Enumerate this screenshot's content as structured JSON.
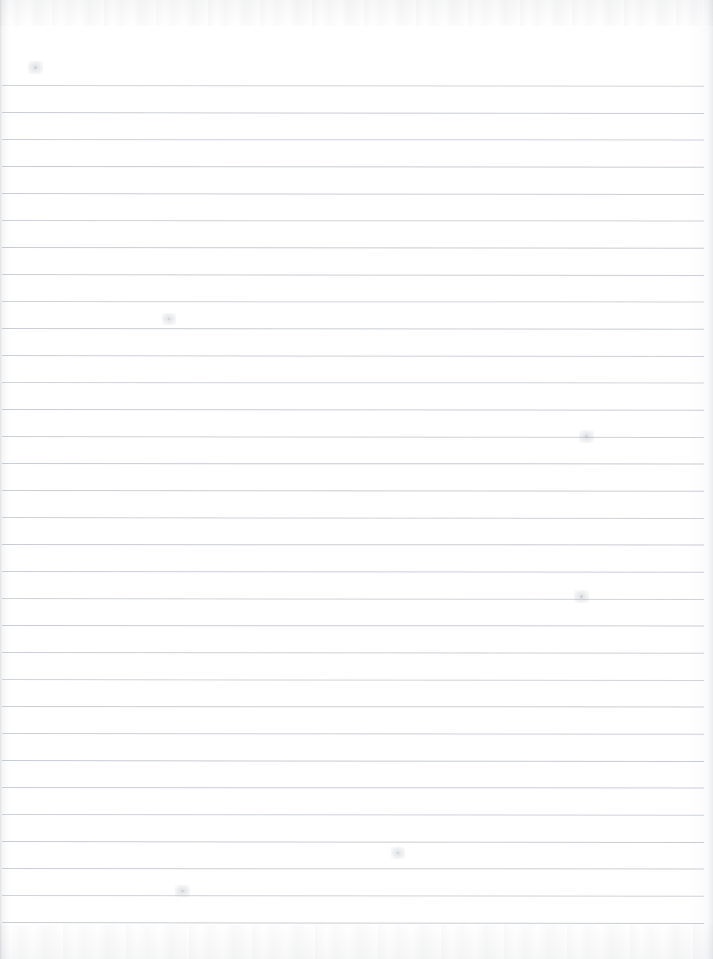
{
  "document": {
    "type": "scanned-lined-notebook-paper",
    "title": "Blank Ruled Notebook Page",
    "page_width": 713,
    "page_height": 959,
    "text_content": "",
    "handwriting": "",
    "printed_text": "",
    "is_blank": true
  },
  "paper": {
    "background_color": "#ffffff",
    "surface_tone": "#fdfdfe",
    "line_color": "#c6cad1",
    "edge_shadow_color": "#8c929b"
  },
  "ruling": {
    "style": "wide-ruled horizontal lines",
    "line_count": 32,
    "first_line_y": 85,
    "line_spacing": 27,
    "line_thickness": 1,
    "line_left_x": 2,
    "line_right_x": 704,
    "has_vertical_margin_line": false,
    "top_margin": 85,
    "bottom_margin": 37,
    "lines_y": [
      85,
      112,
      139,
      166,
      193,
      220,
      247,
      274,
      301,
      328,
      355,
      382,
      409,
      436,
      463,
      490,
      517,
      544,
      571,
      598,
      625,
      652,
      679,
      706,
      733,
      760,
      787,
      814,
      841,
      868,
      895,
      922
    ]
  },
  "artifacts": {
    "description": "faint scanner noise along top and bottom edges, light binding shadow on left edge",
    "marks": [
      {
        "name": "speck-upper-right",
        "x": 585,
        "y": 435,
        "w": 3,
        "h": 3
      },
      {
        "name": "speck-mid-right",
        "x": 580,
        "y": 595,
        "w": 3,
        "h": 3
      },
      {
        "name": "speck-lower-left",
        "x": 181,
        "y": 890,
        "w": 3,
        "h": 2
      },
      {
        "name": "speck-upper-left",
        "x": 34,
        "y": 66,
        "w": 3,
        "h": 3
      },
      {
        "name": "speck-mid-left",
        "x": 168,
        "y": 318,
        "w": 2,
        "h": 2
      },
      {
        "name": "speck-center",
        "x": 397,
        "y": 852,
        "w": 2,
        "h": 2
      }
    ]
  }
}
